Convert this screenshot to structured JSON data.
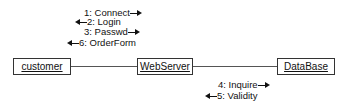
{
  "objects": {
    "customer": "customer",
    "webserver": "WebServer",
    "database": "DataBase"
  },
  "messages_customer_webserver": [
    {
      "label": "1: Connect",
      "direction": "right"
    },
    {
      "label": "2: Login",
      "direction": "left"
    },
    {
      "label": "3: Passwd",
      "direction": "right"
    },
    {
      "label": "6: OrderForm",
      "direction": "left"
    }
  ],
  "messages_webserver_database": [
    {
      "label": "4: Inquire",
      "direction": "right"
    },
    {
      "label": "5: Validity",
      "direction": "left"
    }
  ]
}
